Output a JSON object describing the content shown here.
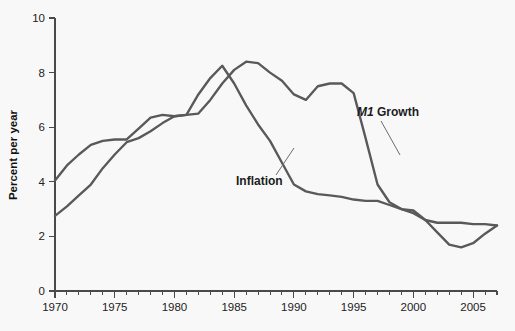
{
  "chart_data": {
    "type": "line",
    "title": "",
    "subtitle": "",
    "xlabel": "",
    "ylabel": "Percent per year",
    "xlim": [
      1970,
      2007
    ],
    "ylim": [
      0,
      10
    ],
    "yticks": [
      0,
      2,
      4,
      6,
      8,
      10
    ],
    "ytick_labels": [
      "0",
      "2",
      "4",
      "6",
      "8",
      "10"
    ],
    "xticks": [
      1970,
      1975,
      1980,
      1985,
      1990,
      1995,
      2000,
      2005
    ],
    "xtick_labels": [
      "1970",
      "1975",
      "1980",
      "1985",
      "1990",
      "1995",
      "2000",
      "2005"
    ],
    "x_minor_tick_interval": 1,
    "grid": false,
    "legend_position": "inline-annotations",
    "line_color": "#59595b",
    "background_color": "#f8f8f8",
    "x": [
      1970,
      1971,
      1972,
      1973,
      1974,
      1975,
      1976,
      1977,
      1978,
      1979,
      1980,
      1981,
      1982,
      1983,
      1984,
      1985,
      1986,
      1987,
      1988,
      1989,
      1990,
      1991,
      1992,
      1993,
      1994,
      1995,
      1996,
      1997,
      1998,
      1999,
      2000,
      2001,
      2002,
      2003,
      2004,
      2005,
      2006,
      2007
    ],
    "series": [
      {
        "name": "M1 Growth",
        "label": "M1 Growth",
        "label_italic_part": "M1",
        "label_regular_part": " Growth",
        "color": "#59595b",
        "values": [
          2.75,
          3.1,
          3.5,
          3.9,
          4.5,
          5.0,
          5.45,
          5.6,
          5.85,
          6.15,
          6.4,
          6.45,
          6.5,
          7.0,
          7.6,
          8.1,
          8.4,
          8.35,
          8.0,
          7.7,
          7.2,
          7.0,
          7.5,
          7.6,
          7.6,
          7.25,
          5.6,
          3.9,
          3.25,
          3.0,
          2.85,
          2.6,
          2.15,
          1.7,
          1.6,
          1.75,
          2.1,
          2.4
        ]
      },
      {
        "name": "Inflation",
        "label": "Inflation",
        "color": "#59595b",
        "values": [
          4.05,
          4.6,
          5.0,
          5.35,
          5.5,
          5.55,
          5.55,
          5.95,
          6.35,
          6.45,
          6.4,
          6.45,
          7.2,
          7.8,
          8.25,
          7.6,
          6.8,
          6.1,
          5.5,
          4.7,
          3.9,
          3.65,
          3.55,
          3.5,
          3.45,
          3.35,
          3.3,
          3.3,
          3.15,
          3.0,
          2.95,
          2.6,
          2.5,
          2.5,
          2.5,
          2.45,
          2.45,
          2.4
        ]
      }
    ],
    "annotations": [
      {
        "text": "Inflation",
        "series": "Inflation",
        "text_x_px": 236,
        "text_y_px": 185,
        "leader_from_x_px": 276,
        "leader_from_y_px": 175,
        "leader_to_x_px": 294,
        "leader_to_y_px": 148
      },
      {
        "text": "M1 Growth",
        "series": "M1 Growth",
        "text_x_px": 357,
        "text_y_px": 116,
        "leader_from_x_px": 381,
        "leader_from_y_px": 121,
        "leader_to_x_px": 400,
        "leader_to_y_px": 155
      }
    ]
  },
  "geometry": {
    "plot_left_px": 55,
    "plot_right_px": 497,
    "plot_bottom_px": 291,
    "plot_top_px": 18
  }
}
